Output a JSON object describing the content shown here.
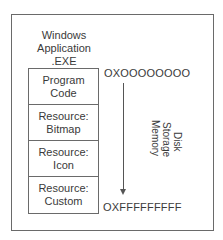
{
  "diagram": {
    "title_lines": [
      "Windows",
      "Application",
      ".EXE"
    ],
    "segments": [
      {
        "line1": "Program",
        "line2": "Code"
      },
      {
        "line1": "Resource:",
        "line2": "Bitmap"
      },
      {
        "line1": "Resource:",
        "line2": "Icon"
      },
      {
        "line1": "Resource:",
        "line2": "Custom"
      }
    ],
    "start_address": "OXOOOOOOOO",
    "end_address": "OXFFFFFFFFF",
    "arrow_label_lines": [
      "Disk",
      "Storage",
      "Memory"
    ],
    "colors": {
      "line": "#6a6a6a",
      "text": "#3a3a3a"
    }
  }
}
